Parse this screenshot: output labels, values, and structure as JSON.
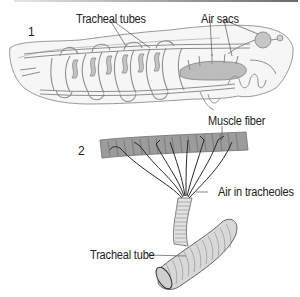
{
  "figure": {
    "panel1": {
      "number": "1",
      "labels": {
        "tracheal_tubes": "Tracheal tubes",
        "air_sacs": "Air sacs"
      }
    },
    "panel2": {
      "number": "2",
      "labels": {
        "muscle_fiber": "Muscle fiber",
        "air_in_tracheoles": "Air in tracheoles",
        "tracheal_tube": "Tracheal tube"
      }
    }
  },
  "colors": {
    "outline": "#8a8a8a",
    "body_fill": "#f4f4f4",
    "tube_fill": "#cfcfcf",
    "air_sac_fill": "#bdbdbd",
    "muscle_fill": "#9b9b9b",
    "tracheole_stroke": "#2a2a2a",
    "text": "#222222"
  }
}
